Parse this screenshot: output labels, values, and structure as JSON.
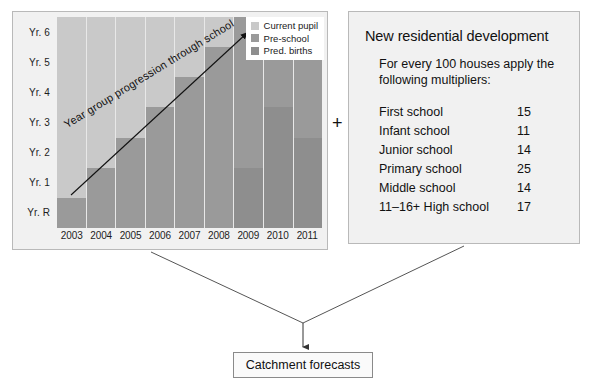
{
  "chart_data": {
    "type": "bar",
    "title": "",
    "xlabel": "",
    "ylabel": "",
    "grid": false,
    "legend_position": "top-right",
    "categories": [
      "2003",
      "2004",
      "2005",
      "2006",
      "2007",
      "2008",
      "2009",
      "2010",
      "2011"
    ],
    "y_categories": [
      "Yr. 6",
      "Yr. 5",
      "Yr. 4",
      "Yr. 3",
      "Yr. 2",
      "Yr. 1",
      "Yr. R"
    ],
    "legend": [
      {
        "label": "Current pupil",
        "color": "#c9c9c9"
      },
      {
        "label": "Pre-school",
        "color": "#9a9a9a"
      },
      {
        "label": "Pred. births",
        "color": "#8e8e8e"
      }
    ],
    "annotation": "Year group progression through school",
    "note": "Stacked columns by year group band (Yr. R at bottom to Yr. 6 at top). Values are the number of year-group bands in each category per calendar year.",
    "series": [
      {
        "name": "Current pupil",
        "values": [
          6,
          5,
          4,
          3,
          2,
          1,
          0,
          0,
          0
        ]
      },
      {
        "name": "Pre-school",
        "values": [
          1,
          2,
          3,
          4,
          5,
          6,
          5,
          3,
          4
        ]
      },
      {
        "name": "Pred. births",
        "values": [
          0,
          0,
          0,
          0,
          0,
          0,
          2,
          4,
          3
        ]
      }
    ],
    "columns": [
      {
        "year": "2003",
        "current_pupil": 6,
        "pre_school": 1,
        "pred_births": 0
      },
      {
        "year": "2004",
        "current_pupil": 5,
        "pre_school": 2,
        "pred_births": 0
      },
      {
        "year": "2005",
        "current_pupil": 4,
        "pre_school": 3,
        "pred_births": 0
      },
      {
        "year": "2006",
        "current_pupil": 3,
        "pre_school": 4,
        "pred_births": 0
      },
      {
        "year": "2007",
        "current_pupil": 2,
        "pre_school": 5,
        "pred_births": 0
      },
      {
        "year": "2008",
        "current_pupil": 1,
        "pre_school": 6,
        "pred_births": 0
      },
      {
        "year": "2009",
        "current_pupil": 0,
        "pre_school": 5,
        "pred_births": 2
      },
      {
        "year": "2010",
        "current_pupil": 0,
        "pre_school": 3,
        "pred_births": 4
      },
      {
        "year": "2011",
        "current_pupil": 0,
        "pre_school": 4,
        "pred_births": 3
      }
    ]
  },
  "info_panel": {
    "title": "New residential development",
    "subtitle": "For every 100 houses apply the following multipliers:",
    "rows": [
      {
        "label": "First school",
        "value": "15"
      },
      {
        "label": "Infant school",
        "value": "11"
      },
      {
        "label": "Junior school",
        "value": "14"
      },
      {
        "label": "Primary school",
        "value": "25"
      },
      {
        "label": "Middle school",
        "value": "14"
      },
      {
        "label": "11–16+ High school",
        "value": "17"
      }
    ]
  },
  "operator": {
    "plus": "+"
  },
  "outcome": {
    "label": "Catchment forecasts"
  },
  "colors": {
    "current_pupil": "#c9c9c9",
    "pre_school": "#9a9a9a",
    "pred_births": "#8e8e8e",
    "panel_bg": "#f1f1f1",
    "panel_border": "#b9b9b9",
    "connector": "#555555"
  }
}
